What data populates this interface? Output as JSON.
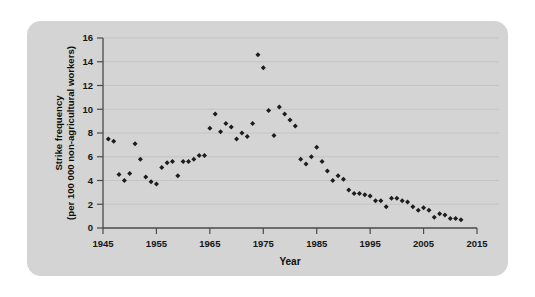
{
  "figure": {
    "panel_background": "#d4d4d4",
    "page_background": "#ffffff",
    "marker_color": "#1c1c1c",
    "axis_color": "#4a4a4a",
    "grid_color": "#bdbdbd"
  },
  "chart_data": {
    "type": "scatter",
    "title": "",
    "xlabel": "Year",
    "ylabel": "Strike frequency (per 100 000 non-agricultural workers)",
    "ylabel_line1": "Strike frequency",
    "ylabel_line2": "(per 100 000 non-agricultural workers)",
    "xlim": [
      1945,
      2015
    ],
    "ylim": [
      0,
      16
    ],
    "xticks": [
      1945,
      1955,
      1965,
      1975,
      1985,
      1995,
      2005,
      2015
    ],
    "yticks": [
      0,
      2,
      4,
      6,
      8,
      10,
      12,
      14,
      16
    ],
    "xtick_labels": [
      "1945",
      "1955",
      "1965",
      "1975",
      "1985",
      "1995",
      "2005",
      "2015"
    ],
    "ytick_labels": [
      "0",
      "2",
      "4",
      "6",
      "8",
      "10",
      "12",
      "14",
      "16"
    ],
    "grid": "horizontal",
    "legend": "none",
    "marker": "diamond",
    "points": [
      {
        "x": 1946,
        "y": 7.5
      },
      {
        "x": 1947,
        "y": 7.3
      },
      {
        "x": 1948,
        "y": 4.5
      },
      {
        "x": 1949,
        "y": 4.0
      },
      {
        "x": 1950,
        "y": 4.6
      },
      {
        "x": 1951,
        "y": 7.1
      },
      {
        "x": 1952,
        "y": 5.8
      },
      {
        "x": 1953,
        "y": 4.3
      },
      {
        "x": 1954,
        "y": 3.9
      },
      {
        "x": 1955,
        "y": 3.7
      },
      {
        "x": 1956,
        "y": 5.1
      },
      {
        "x": 1957,
        "y": 5.5
      },
      {
        "x": 1958,
        "y": 5.6
      },
      {
        "x": 1959,
        "y": 4.4
      },
      {
        "x": 1960,
        "y": 5.6
      },
      {
        "x": 1961,
        "y": 5.6
      },
      {
        "x": 1962,
        "y": 5.8
      },
      {
        "x": 1963,
        "y": 6.1
      },
      {
        "x": 1964,
        "y": 6.1
      },
      {
        "x": 1965,
        "y": 8.4
      },
      {
        "x": 1966,
        "y": 9.6
      },
      {
        "x": 1967,
        "y": 8.1
      },
      {
        "x": 1968,
        "y": 8.8
      },
      {
        "x": 1969,
        "y": 8.5
      },
      {
        "x": 1970,
        "y": 7.5
      },
      {
        "x": 1971,
        "y": 8.0
      },
      {
        "x": 1972,
        "y": 7.7
      },
      {
        "x": 1973,
        "y": 8.8
      },
      {
        "x": 1974,
        "y": 14.6
      },
      {
        "x": 1975,
        "y": 13.5
      },
      {
        "x": 1976,
        "y": 9.9
      },
      {
        "x": 1977,
        "y": 7.8
      },
      {
        "x": 1978,
        "y": 10.2
      },
      {
        "x": 1979,
        "y": 9.6
      },
      {
        "x": 1980,
        "y": 9.1
      },
      {
        "x": 1981,
        "y": 8.6
      },
      {
        "x": 1982,
        "y": 5.8
      },
      {
        "x": 1983,
        "y": 5.4
      },
      {
        "x": 1984,
        "y": 6.0
      },
      {
        "x": 1985,
        "y": 6.8
      },
      {
        "x": 1986,
        "y": 5.6
      },
      {
        "x": 1987,
        "y": 4.8
      },
      {
        "x": 1988,
        "y": 4.0
      },
      {
        "x": 1989,
        "y": 4.4
      },
      {
        "x": 1990,
        "y": 4.1
      },
      {
        "x": 1991,
        "y": 3.2
      },
      {
        "x": 1992,
        "y": 2.9
      },
      {
        "x": 1993,
        "y": 2.9
      },
      {
        "x": 1994,
        "y": 2.8
      },
      {
        "x": 1995,
        "y": 2.7
      },
      {
        "x": 1996,
        "y": 2.3
      },
      {
        "x": 1997,
        "y": 2.3
      },
      {
        "x": 1998,
        "y": 1.8
      },
      {
        "x": 1999,
        "y": 2.5
      },
      {
        "x": 2000,
        "y": 2.5
      },
      {
        "x": 2001,
        "y": 2.3
      },
      {
        "x": 2002,
        "y": 2.2
      },
      {
        "x": 2003,
        "y": 1.8
      },
      {
        "x": 2004,
        "y": 1.5
      },
      {
        "x": 2005,
        "y": 1.7
      },
      {
        "x": 2006,
        "y": 1.5
      },
      {
        "x": 2007,
        "y": 0.9
      },
      {
        "x": 2008,
        "y": 1.2
      },
      {
        "x": 2009,
        "y": 1.1
      },
      {
        "x": 2010,
        "y": 0.8
      },
      {
        "x": 2011,
        "y": 0.8
      },
      {
        "x": 2012,
        "y": 0.7
      }
    ]
  }
}
